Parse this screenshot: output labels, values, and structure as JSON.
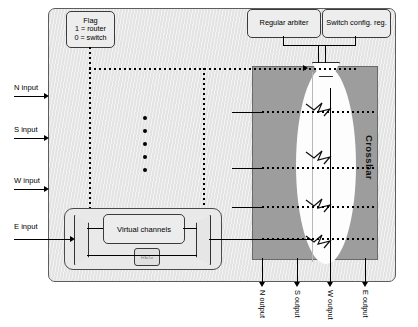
{
  "diagram": {
    "panel_name": "router-panel"
  },
  "flag_box": {
    "line1": "Flag",
    "line2": "1 = router",
    "line3": "0 = switch"
  },
  "top_boxes": {
    "arbiter": "Regular arbiter",
    "switch_config": "Switch config. reg."
  },
  "crossbar": {
    "label": "Crossbar"
  },
  "virtual_channels": {
    "label": "Virtual channels",
    "reg_label": "REG"
  },
  "inputs": [
    {
      "label": "N input"
    },
    {
      "label": "S input"
    },
    {
      "label": "W input"
    },
    {
      "label": "E input"
    }
  ],
  "outputs": [
    {
      "label": "N output"
    },
    {
      "label": "S output"
    },
    {
      "label": "W output"
    },
    {
      "label": "E output"
    }
  ],
  "colors": {
    "panel_bg": "#e4e4e4",
    "crossbar_bg": "#9d9d9d",
    "box_bg": "#ededed",
    "line": "#000000"
  }
}
